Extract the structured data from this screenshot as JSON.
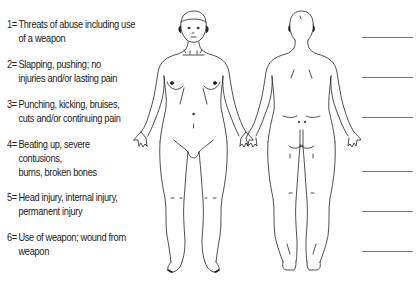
{
  "legend": {
    "items": [
      {
        "num": "1=",
        "lines": [
          "Threats of abuse including use",
          "of a weapon"
        ]
      },
      {
        "num": "2=",
        "lines": [
          "Slapping, pushing; no",
          "injuries and/or lasting pain"
        ]
      },
      {
        "num": "3=",
        "lines": [
          "Punching, kicking, bruises,",
          "cuts and/or continuing pain"
        ]
      },
      {
        "num": "4=",
        "lines": [
          "Beating up, severe",
          "contusions,",
          "burns, broken bones"
        ]
      },
      {
        "num": "5=",
        "lines": [
          "Head injury, internal injury,",
          "permanent injury"
        ]
      },
      {
        "num": "6=",
        "lines": [
          "Use of weapon; wound from",
          "weapon"
        ]
      }
    ]
  },
  "figures": {
    "front": "front-body-outline",
    "back": "back-body-outline"
  },
  "answer_blanks": 6,
  "caption": "(Text partially cut off at bottom edge)",
  "colors": {
    "ink": "#1a1a1a",
    "blank_line": "#777777"
  }
}
